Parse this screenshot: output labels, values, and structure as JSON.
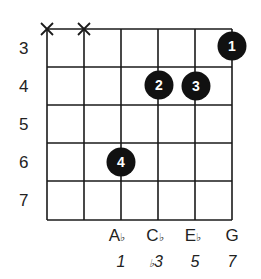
{
  "diagram": {
    "type": "guitar-chord-diagram",
    "fret_numbers": [
      "3",
      "4",
      "5",
      "6",
      "7"
    ],
    "strings_count": 6,
    "muted_strings": [
      1,
      2
    ],
    "muted_symbol": "X",
    "fingers": [
      {
        "finger": "1",
        "string": 6,
        "fret": 3
      },
      {
        "finger": "2",
        "string": 4,
        "fret": 4
      },
      {
        "finger": "3",
        "string": 5,
        "fret": 4
      },
      {
        "finger": "4",
        "string": 3,
        "fret": 6
      }
    ],
    "notes": [
      {
        "string": 3,
        "root": "A",
        "accidental": "♭"
      },
      {
        "string": 4,
        "root": "C",
        "accidental": "♭"
      },
      {
        "string": 5,
        "root": "E",
        "accidental": "♭"
      },
      {
        "string": 6,
        "root": "G",
        "accidental": ""
      }
    ],
    "intervals": [
      {
        "string": 3,
        "prefix": "",
        "value": "1"
      },
      {
        "string": 4,
        "prefix": "♭",
        "value": "3"
      },
      {
        "string": 5,
        "prefix": "",
        "value": "5"
      },
      {
        "string": 6,
        "prefix": "",
        "value": "7"
      }
    ],
    "colors": {
      "line": "#1a1a1a",
      "dot": "#111111",
      "dot_text": "#ffffff",
      "background": "#ffffff"
    }
  }
}
